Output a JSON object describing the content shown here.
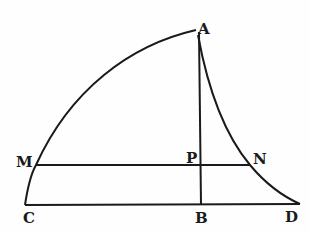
{
  "diagram": {
    "points": {
      "A": {
        "label": "A",
        "x": 196,
        "y": 30
      },
      "B": {
        "label": "B",
        "x": 200,
        "y": 205
      },
      "C": {
        "label": "C",
        "x": 25,
        "y": 205
      },
      "D": {
        "label": "D",
        "x": 300,
        "y": 204
      },
      "M": {
        "label": "M",
        "x": 36,
        "y": 165
      },
      "P": {
        "label": "P",
        "x": 200,
        "y": 165
      },
      "N": {
        "label": "N",
        "x": 250,
        "y": 165
      }
    },
    "segments": [
      "AB",
      "CD",
      "MN"
    ],
    "curves": [
      "C-M-A (convex arc)",
      "A-N-D (concave curve)"
    ],
    "stroke_color": "#1a1a1a"
  }
}
